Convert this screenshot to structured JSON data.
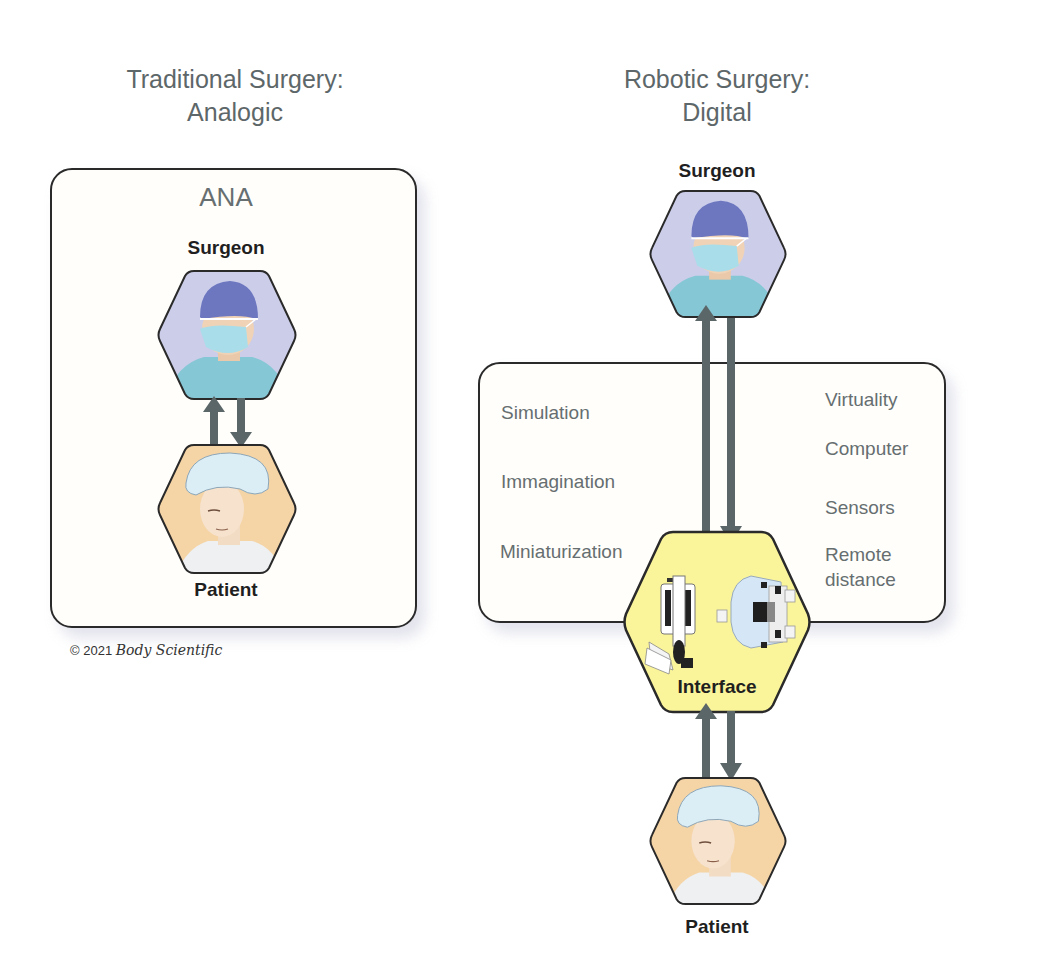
{
  "left_panel": {
    "title_line1": "Traditional Surgery:",
    "title_line2": "Analogic",
    "box_label": "ANA",
    "surgeon_label": "Surgeon",
    "patient_label": "Patient",
    "arrows": [
      {
        "direction": "up",
        "from": "Patient",
        "to": "Surgeon"
      },
      {
        "direction": "down",
        "from": "Surgeon",
        "to": "Patient"
      }
    ]
  },
  "right_panel": {
    "title_line1": "Robotic Surgery:",
    "title_line2": "Digital",
    "surgeon_label": "Surgeon",
    "interface_label": "Interface",
    "patient_label": "Patient",
    "features_left": [
      "Simulation",
      "Immagination",
      "Miniaturization"
    ],
    "features_right": [
      "Virtuality",
      "Computer",
      "Sensors",
      "Remote",
      "distance"
    ],
    "arrows": [
      {
        "direction": "up",
        "from": "Interface",
        "to": "Surgeon"
      },
      {
        "direction": "down",
        "from": "Surgeon",
        "to": "Interface"
      },
      {
        "direction": "up",
        "from": "Patient",
        "to": "Interface"
      },
      {
        "direction": "down",
        "from": "Interface",
        "to": "Patient"
      }
    ]
  },
  "copyright": {
    "text": "© 2021",
    "brand": "Body Scientific"
  },
  "colors": {
    "surgeon_hex_fill": "#c9cbe8",
    "patient_hex_fill": "#f5d4a6",
    "interface_hex_fill": "#faf49a",
    "arrow": "#5a6668",
    "title_text": "#5d6769",
    "border": "#2a2a2a"
  },
  "icons": {
    "surgeon": "surgeon-portrait-icon",
    "patient": "patient-portrait-icon",
    "interface": "robotic-console-icon"
  }
}
